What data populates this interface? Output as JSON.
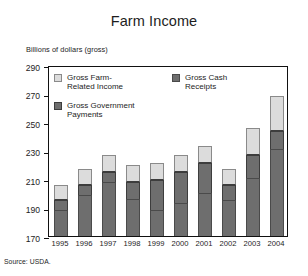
{
  "chart_data": {
    "type": "bar",
    "title": "Farm Income",
    "subtitle": "Billions of dollars (gross)",
    "xlabel": "",
    "ylabel": "Billions of dollars (gross)",
    "ylim": [
      170,
      290
    ],
    "yticks": [
      170,
      190,
      210,
      230,
      250,
      270,
      290
    ],
    "grid": false,
    "stacked": true,
    "legend_position": "inside-top",
    "categories": [
      "1995",
      "1996",
      "1997",
      "1998",
      "1999",
      "2000",
      "2001",
      "2002",
      "2003",
      "2004"
    ],
    "series": [
      {
        "name": "Gross Cash Receipts",
        "color": "#6e6e6e",
        "values": [
          188,
          199,
          208,
          196,
          188,
          193,
          200,
          195,
          211,
          231
        ]
      },
      {
        "name": "Gross Government Payments",
        "color": "#6e6e6e",
        "values": [
          7,
          7,
          7,
          12,
          21,
          22,
          21,
          11,
          16,
          13
        ]
      },
      {
        "name": "Gross Farm-Related Income",
        "color": "#dcdcdc",
        "values": [
          11,
          11,
          12,
          12,
          12,
          12,
          12,
          11,
          19,
          24
        ]
      }
    ],
    "totals": [
      206,
      217,
      227,
      220,
      221,
      227,
      233,
      217,
      246,
      268
    ],
    "annotations": [
      "Source: USDA."
    ]
  },
  "header": {
    "title": "Farm Income",
    "axis_note": "Billions of dollars (gross)"
  },
  "legend": {
    "items": [
      {
        "label": "Gross Farm-\nRelated Income",
        "swatch": "farm"
      },
      {
        "label": "Gross Cash\nReceipts",
        "swatch": "cash"
      },
      {
        "label": "Gross Government\nPayments",
        "swatch": "govt"
      }
    ]
  },
  "footer": {
    "source": "Source: USDA."
  }
}
